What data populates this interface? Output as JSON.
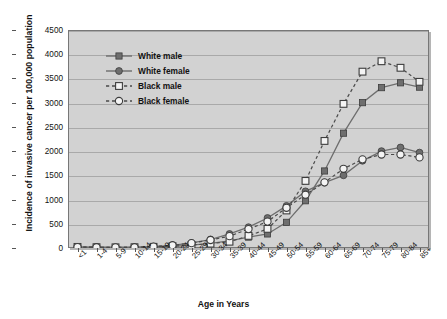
{
  "chart_data": {
    "type": "line",
    "title": "",
    "xlabel": "Age in Years",
    "ylabel": "Incidence of invasive cancer per 100,000 population",
    "categories": [
      "<1",
      "1-4",
      "5-9",
      "10-14",
      "15-19",
      "20-24",
      "25-29",
      "30-34",
      "35-39",
      "40-44",
      "45-49",
      "50-54",
      "55-59",
      "60-64",
      "65-69",
      "70-74",
      "75-79",
      "80-84",
      "85+"
    ],
    "ylim": [
      0,
      4500
    ],
    "ytick_step": 500,
    "yticks": [
      0,
      500,
      1000,
      1500,
      2000,
      2500,
      3000,
      3500,
      4000,
      4500
    ],
    "ytick_labels": [
      "0",
      "500",
      "1000",
      "1500",
      "2000",
      "2500",
      "3000",
      "3500",
      "4000",
      "4500"
    ],
    "grid": true,
    "legend_position": "upper left",
    "series": [
      {
        "name": "White male",
        "marker": "filled-square",
        "line_style": "solid",
        "color": "#6e6e6e",
        "values": [
          20,
          15,
          12,
          14,
          22,
          34,
          58,
          95,
          145,
          225,
          290,
          530,
          975,
          1590,
          2370,
          3000,
          3310,
          3410,
          3320
        ]
      },
      {
        "name": "White female",
        "marker": "filled-circle",
        "line_style": "solid",
        "color": "#6e6e6e",
        "values": [
          18,
          14,
          12,
          16,
          28,
          55,
          105,
          175,
          290,
          430,
          620,
          870,
          1170,
          1350,
          1500,
          1800,
          2000,
          2075,
          1970
        ]
      },
      {
        "name": "Black male",
        "marker": "open-square",
        "line_style": "dashed",
        "color": "#4a4a4a",
        "values": [
          22,
          16,
          13,
          15,
          24,
          38,
          60,
          90,
          130,
          250,
          395,
          775,
          1385,
          2210,
          2975,
          3640,
          3855,
          3720,
          3430
        ]
      },
      {
        "name": "Black female",
        "marker": "open-circle",
        "line_style": "dashed",
        "color": "#4a4a4a",
        "values": [
          20,
          15,
          12,
          16,
          30,
          58,
          100,
          165,
          245,
          390,
          545,
          830,
          1100,
          1355,
          1635,
          1830,
          1930,
          1930,
          1870
        ]
      }
    ]
  },
  "legend": {
    "items": [
      {
        "label": "White male"
      },
      {
        "label": "White female"
      },
      {
        "label": "Black male"
      },
      {
        "label": "Black female"
      }
    ]
  }
}
